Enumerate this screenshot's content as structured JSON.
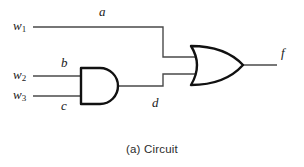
{
  "figure": {
    "caption": "(a) Circuit",
    "type": "logic-circuit-diagram"
  },
  "colors": {
    "wire": "#4a4a4a",
    "gate_outline": "#111111",
    "text": "#1a1a1a",
    "caption_text": "#2b2b2b",
    "background": "#ffffff"
  },
  "inputs": [
    {
      "id": "w1",
      "name": "w",
      "subscript": "1",
      "wire_label": "a"
    },
    {
      "id": "w2",
      "name": "w",
      "subscript": "2",
      "wire_label": "b"
    },
    {
      "id": "w3",
      "name": "w",
      "subscript": "3",
      "wire_label": "c"
    }
  ],
  "wires": {
    "a": "a",
    "b": "b",
    "c": "c",
    "d": "d",
    "f": "f"
  },
  "gates": [
    {
      "id": "and-gate",
      "type": "AND",
      "inputs": [
        "b",
        "c"
      ],
      "output": "d"
    },
    {
      "id": "or-gate",
      "type": "OR",
      "inputs": [
        "a",
        "d"
      ],
      "output": "f"
    }
  ],
  "output": {
    "id": "f",
    "label": "f"
  }
}
